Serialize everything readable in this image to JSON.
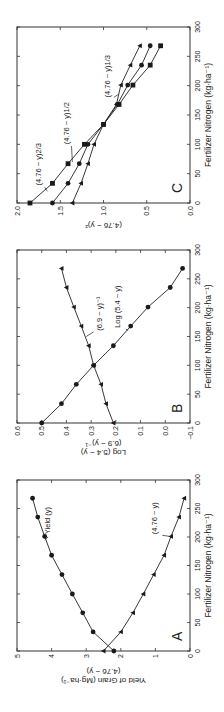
{
  "chart_data": [
    {
      "panel": "A",
      "type": "line",
      "title": "",
      "xlabel": "Fertilizer Nitrogen (kg·ha⁻¹)",
      "ylabel": "Yield of Grain (Mg·ha⁻¹)",
      "ylabel2": "(4.76 − y)",
      "xlim": [
        0,
        300
      ],
      "ylim": [
        0,
        5
      ],
      "xticks": [
        0,
        50,
        100,
        150,
        200,
        250,
        300
      ],
      "yticks": [
        0,
        1,
        2,
        3,
        4,
        5
      ],
      "x": [
        0,
        33.5,
        67,
        100,
        134,
        168,
        201,
        235,
        268
      ],
      "series": [
        {
          "name": "Yield (y)",
          "marker": "circle",
          "values": [
            2.2,
            2.8,
            3.1,
            3.4,
            3.7,
            4.0,
            4.2,
            4.4,
            4.55
          ]
        },
        {
          "name": "(4.76 − y)",
          "marker": "triangle",
          "values": [
            2.5,
            2.0,
            1.65,
            1.35,
            1.05,
            0.75,
            0.55,
            0.32,
            0.17
          ]
        }
      ],
      "grid": false
    },
    {
      "panel": "B",
      "type": "line",
      "title": "",
      "xlabel": "Fertilizer Nitrogen (kg·ha⁻¹)",
      "ylabel": "Log (5.4 − y)",
      "ylabel2": "(6.9 − y)⁻¹",
      "xlim": [
        0,
        300
      ],
      "ylim": [
        -0.1,
        0.6
      ],
      "xticks": [
        0,
        50,
        100,
        150,
        200,
        250,
        300
      ],
      "yticks": [
        -0.1,
        0.0,
        0.1,
        0.2,
        0.3,
        0.4,
        0.5,
        0.6
      ],
      "x": [
        0,
        33.5,
        67,
        100,
        134,
        168,
        201,
        235,
        268
      ],
      "series": [
        {
          "name": "Log (5.4 − y)",
          "marker": "circle",
          "values": [
            0.5,
            0.42,
            0.36,
            0.29,
            0.21,
            0.14,
            0.07,
            -0.02,
            -0.07
          ]
        },
        {
          "name": "(6.9 − y)⁻¹",
          "marker": "triangle",
          "values": [
            0.21,
            0.24,
            0.26,
            0.29,
            0.31,
            0.34,
            0.37,
            0.4,
            0.42
          ]
        }
      ],
      "grid": false
    },
    {
      "panel": "C",
      "type": "line",
      "title": "",
      "xlabel": "Fertilizer Nitrogen (kg·ha⁻¹)",
      "ylabel": "(4.76 − y)ᶻ",
      "xlim": [
        0,
        300
      ],
      "ylim": [
        0,
        2.0
      ],
      "xticks": [
        0,
        50,
        100,
        150,
        200,
        250,
        300
      ],
      "yticks": [
        0.0,
        0.5,
        1.0,
        1.5,
        2.0
      ],
      "x": [
        0,
        33.5,
        67,
        100,
        134,
        168,
        201,
        235,
        268
      ],
      "series": [
        {
          "name": "(4.76 − y)^2/3",
          "marker": "square",
          "values": [
            1.85,
            1.59,
            1.41,
            1.22,
            1.0,
            0.82,
            0.66,
            0.46,
            0.34
          ]
        },
        {
          "name": "(4.76 − y)^1/2",
          "marker": "circle",
          "values": [
            1.59,
            1.41,
            1.28,
            1.18,
            1.0,
            0.84,
            0.72,
            0.56,
            0.46
          ]
        },
        {
          "name": "(4.76 − y)^1/3",
          "marker": "triangle",
          "values": [
            1.36,
            1.26,
            1.18,
            1.11,
            1.0,
            0.85,
            0.8,
            0.69,
            0.58
          ]
        }
      ],
      "grid": false
    }
  ],
  "figure": {
    "orientation": "rotated 90° counter-clockwise",
    "panel_labels": [
      "A",
      "B",
      "C"
    ],
    "annotations": {
      "A": [
        "Yield (y)",
        "(4.76 − y)"
      ],
      "B": [
        "(6.9 − y)⁻¹",
        "Log (5.4 − y)"
      ],
      "C": [
        "(4.76 − y)2/3",
        "(4.76 − y)1/2",
        "(4.76 − y)1/3"
      ]
    }
  }
}
